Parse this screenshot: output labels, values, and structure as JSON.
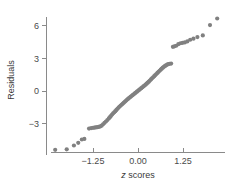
{
  "chart_data": {
    "type": "scatter",
    "title": "",
    "subtitle": "",
    "xlabel": "z scores",
    "xlabel_italic_prefix": "z",
    "xlabel_rest": " scores",
    "ylabel": "Residuals",
    "xlim": [
      -2.45,
      2.35
    ],
    "ylim": [
      -6.2,
      7.2
    ],
    "xticks": [
      -1.25,
      0.0,
      1.25
    ],
    "xtick_labels": [
      "−1.25",
      "0.00",
      "1.25"
    ],
    "yticks": [
      -3,
      0,
      3,
      6
    ],
    "ytick_labels": [
      "−3",
      "0",
      "3",
      "6"
    ],
    "grid": false,
    "legend": "none",
    "marker_color": "#808080",
    "axis_color": "#8a8a8a",
    "marker_size": 2.1,
    "points": [
      [
        -2.3,
        -5.4
      ],
      [
        -1.98,
        -5.35
      ],
      [
        -1.78,
        -5.0
      ],
      [
        -1.66,
        -4.75
      ],
      [
        -1.56,
        -4.45
      ],
      [
        -1.49,
        -4.4
      ],
      [
        -1.36,
        -3.45
      ],
      [
        -1.3,
        -3.4
      ],
      [
        -1.25,
        -3.38
      ],
      [
        -1.21,
        -3.36
      ],
      [
        -1.17,
        -3.34
      ],
      [
        -1.13,
        -3.32
      ],
      [
        -1.09,
        -3.3
      ],
      [
        -1.05,
        -3.25
      ],
      [
        -1.01,
        -3.18
      ],
      [
        -0.97,
        -3.05
      ],
      [
        -0.93,
        -2.92
      ],
      [
        -0.89,
        -2.8
      ],
      [
        -0.85,
        -2.66
      ],
      [
        -0.81,
        -2.52
      ],
      [
        -0.78,
        -2.4
      ],
      [
        -0.75,
        -2.28
      ],
      [
        -0.72,
        -2.16
      ],
      [
        -0.69,
        -2.05
      ],
      [
        -0.66,
        -1.95
      ],
      [
        -0.63,
        -1.85
      ],
      [
        -0.6,
        -1.74
      ],
      [
        -0.57,
        -1.63
      ],
      [
        -0.54,
        -1.52
      ],
      [
        -0.51,
        -1.42
      ],
      [
        -0.48,
        -1.33
      ],
      [
        -0.45,
        -1.24
      ],
      [
        -0.42,
        -1.15
      ],
      [
        -0.39,
        -1.06
      ],
      [
        -0.36,
        -0.97
      ],
      [
        -0.33,
        -0.88
      ],
      [
        -0.3,
        -0.79
      ],
      [
        -0.27,
        -0.7
      ],
      [
        -0.24,
        -0.62
      ],
      [
        -0.21,
        -0.54
      ],
      [
        -0.18,
        -0.46
      ],
      [
        -0.15,
        -0.38
      ],
      [
        -0.12,
        -0.3
      ],
      [
        -0.09,
        -0.22
      ],
      [
        -0.06,
        -0.14
      ],
      [
        -0.03,
        -0.06
      ],
      [
        0.0,
        0.02
      ],
      [
        0.03,
        0.1
      ],
      [
        0.06,
        0.18
      ],
      [
        0.09,
        0.26
      ],
      [
        0.12,
        0.34
      ],
      [
        0.15,
        0.42
      ],
      [
        0.18,
        0.5
      ],
      [
        0.21,
        0.58
      ],
      [
        0.24,
        0.67
      ],
      [
        0.27,
        0.76
      ],
      [
        0.3,
        0.86
      ],
      [
        0.33,
        0.96
      ],
      [
        0.36,
        1.06
      ],
      [
        0.39,
        1.16
      ],
      [
        0.42,
        1.26
      ],
      [
        0.45,
        1.36
      ],
      [
        0.48,
        1.46
      ],
      [
        0.51,
        1.56
      ],
      [
        0.54,
        1.66
      ],
      [
        0.57,
        1.76
      ],
      [
        0.6,
        1.86
      ],
      [
        0.63,
        1.96
      ],
      [
        0.66,
        2.05
      ],
      [
        0.69,
        2.14
      ],
      [
        0.72,
        2.22
      ],
      [
        0.75,
        2.3
      ],
      [
        0.78,
        2.36
      ],
      [
        0.81,
        2.42
      ],
      [
        0.84,
        2.46
      ],
      [
        0.88,
        2.5
      ],
      [
        0.92,
        2.52
      ],
      [
        0.97,
        4.05
      ],
      [
        1.01,
        4.1
      ],
      [
        1.06,
        4.15
      ],
      [
        1.12,
        4.3
      ],
      [
        1.18,
        4.38
      ],
      [
        1.24,
        4.42
      ],
      [
        1.3,
        4.46
      ],
      [
        1.37,
        4.55
      ],
      [
        1.45,
        4.7
      ],
      [
        1.54,
        4.8
      ],
      [
        1.65,
        4.95
      ],
      [
        1.8,
        5.1
      ],
      [
        2.0,
        6.05
      ],
      [
        2.2,
        6.65
      ]
    ]
  }
}
